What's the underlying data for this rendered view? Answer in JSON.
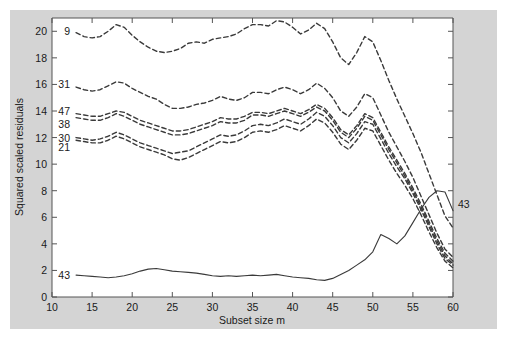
{
  "chart_data": {
    "type": "line",
    "title": "",
    "xlabel": "Subset size m",
    "ylabel": "Squared scaled residuals",
    "xlim": [
      10,
      60
    ],
    "ylim": [
      0,
      21
    ],
    "xticks": [
      10,
      15,
      20,
      25,
      30,
      35,
      40,
      45,
      50,
      55,
      60
    ],
    "yticks": [
      0,
      2,
      4,
      6,
      8,
      10,
      12,
      14,
      16,
      18,
      20
    ],
    "grid": false,
    "legend_position": "inline-labels",
    "x": [
      13,
      14,
      15,
      16,
      17,
      18,
      19,
      20,
      21,
      22,
      23,
      24,
      25,
      26,
      27,
      28,
      29,
      30,
      31,
      32,
      33,
      34,
      35,
      36,
      37,
      38,
      39,
      40,
      41,
      42,
      43,
      44,
      45,
      46,
      47,
      48,
      49,
      50,
      51,
      52,
      53,
      54,
      55,
      56,
      57,
      58,
      59,
      60
    ],
    "series": [
      {
        "name": "9",
        "label": "9",
        "style": "dashed",
        "label_x": 13,
        "label_y": 20.0,
        "values": [
          19.9,
          19.6,
          19.5,
          19.6,
          20.0,
          20.5,
          20.3,
          19.7,
          19.2,
          18.8,
          18.5,
          18.4,
          18.5,
          18.7,
          19.1,
          19.2,
          19.1,
          19.4,
          19.5,
          19.6,
          19.8,
          20.2,
          20.5,
          20.5,
          20.4,
          20.8,
          20.7,
          20.3,
          19.8,
          20.1,
          20.6,
          20.2,
          19.2,
          18.0,
          17.5,
          18.4,
          19.6,
          19.2,
          17.8,
          16.3,
          14.9,
          13.6,
          12.3,
          10.9,
          9.3,
          7.7,
          6.1,
          5.2
        ]
      },
      {
        "name": "31",
        "label": "31",
        "style": "dashed",
        "label_x": 13,
        "label_y": 16.0,
        "values": [
          15.8,
          15.6,
          15.5,
          15.6,
          15.9,
          16.2,
          16.1,
          15.7,
          15.4,
          15.1,
          14.9,
          14.5,
          14.2,
          14.2,
          14.3,
          14.5,
          14.6,
          14.8,
          15.1,
          14.9,
          14.8,
          15.0,
          15.4,
          15.4,
          15.3,
          15.6,
          15.8,
          15.6,
          15.3,
          15.6,
          16.1,
          15.7,
          15.0,
          14.0,
          13.6,
          14.3,
          15.3,
          15.0,
          13.7,
          12.4,
          11.3,
          10.2,
          9.0,
          7.6,
          6.2,
          4.8,
          3.6,
          3.0
        ]
      },
      {
        "name": "47",
        "label": "47",
        "style": "dashed",
        "label_x": 13,
        "label_y": 14.0,
        "values": [
          13.8,
          13.7,
          13.6,
          13.6,
          13.8,
          14.0,
          13.9,
          13.6,
          13.3,
          13.1,
          12.9,
          12.7,
          12.5,
          12.5,
          12.6,
          12.8,
          13.0,
          13.2,
          13.5,
          13.4,
          13.4,
          13.6,
          13.9,
          13.9,
          13.8,
          14.0,
          14.2,
          14.0,
          13.8,
          14.1,
          14.5,
          14.2,
          13.5,
          12.6,
          12.2,
          12.9,
          13.8,
          13.5,
          12.4,
          11.3,
          10.3,
          9.3,
          8.2,
          7.0,
          5.7,
          4.4,
          3.3,
          2.7
        ]
      },
      {
        "name": "38",
        "label": "38",
        "style": "dashed",
        "label_x": 13,
        "label_y": 13.0,
        "values": [
          13.5,
          13.4,
          13.3,
          13.3,
          13.5,
          13.8,
          13.6,
          13.3,
          13.0,
          12.8,
          12.6,
          12.4,
          12.2,
          12.2,
          12.3,
          12.5,
          12.7,
          12.9,
          13.2,
          13.1,
          13.1,
          13.3,
          13.7,
          13.7,
          13.6,
          13.8,
          14.0,
          13.8,
          13.6,
          13.9,
          14.3,
          14.0,
          13.3,
          12.4,
          12.0,
          12.7,
          13.6,
          13.3,
          12.2,
          11.1,
          10.1,
          9.1,
          8.0,
          6.8,
          5.5,
          4.2,
          3.1,
          2.5
        ]
      },
      {
        "name": "30",
        "label": "30",
        "style": "dashed",
        "label_x": 13,
        "label_y": 12.0,
        "values": [
          12.0,
          11.9,
          11.8,
          11.9,
          12.1,
          12.4,
          12.2,
          11.9,
          11.6,
          11.4,
          11.2,
          11.0,
          10.8,
          10.9,
          11.0,
          11.3,
          11.6,
          11.9,
          12.2,
          12.1,
          12.2,
          12.5,
          12.9,
          13.0,
          12.9,
          13.1,
          13.4,
          13.2,
          13.0,
          13.4,
          13.9,
          13.6,
          12.9,
          12.0,
          11.6,
          12.3,
          13.2,
          13.0,
          11.9,
          10.8,
          9.8,
          8.9,
          7.8,
          6.6,
          5.3,
          4.0,
          2.9,
          2.4
        ]
      },
      {
        "name": "21",
        "label": "21",
        "style": "dashed",
        "label_x": 13,
        "label_y": 11.3,
        "values": [
          11.8,
          11.7,
          11.6,
          11.6,
          11.8,
          12.1,
          11.9,
          11.6,
          11.3,
          11.1,
          10.9,
          10.7,
          10.4,
          10.3,
          10.5,
          10.8,
          11.1,
          11.4,
          11.7,
          11.6,
          11.7,
          12.0,
          12.4,
          12.5,
          12.4,
          12.6,
          12.9,
          12.7,
          12.5,
          12.9,
          13.4,
          13.1,
          12.4,
          11.5,
          11.1,
          11.8,
          12.7,
          12.5,
          11.4,
          10.3,
          9.3,
          8.4,
          7.4,
          6.2,
          4.9,
          3.7,
          2.7,
          2.2
        ]
      },
      {
        "name": "43",
        "label": "43",
        "style": "solid",
        "label_x": 13,
        "label_y": 1.65,
        "label_right": "43",
        "label_right_x": 60,
        "label_right_y": 7.0,
        "values": [
          1.65,
          1.6,
          1.55,
          1.5,
          1.45,
          1.5,
          1.6,
          1.75,
          1.95,
          2.1,
          2.15,
          2.05,
          1.95,
          1.9,
          1.85,
          1.8,
          1.7,
          1.6,
          1.55,
          1.6,
          1.55,
          1.6,
          1.65,
          1.6,
          1.65,
          1.7,
          1.6,
          1.5,
          1.45,
          1.4,
          1.3,
          1.25,
          1.4,
          1.7,
          2.0,
          2.4,
          2.8,
          3.4,
          4.7,
          4.4,
          4.0,
          4.6,
          5.6,
          6.6,
          7.5,
          8.0,
          7.9,
          6.5
        ]
      }
    ],
    "labels_left": [
      "9",
      "31",
      "47",
      "38",
      "30",
      "21",
      "43"
    ],
    "labels_right": [
      "43"
    ]
  },
  "figure": {
    "background_color": "#d4d4d4",
    "plot_background_color": "#ffffff",
    "line_color": "#3a3a3a",
    "axis_color": "#555555"
  }
}
